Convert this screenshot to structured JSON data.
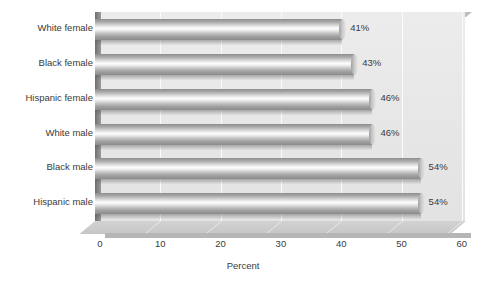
{
  "chart_data": {
    "type": "bar",
    "orientation": "horizontal",
    "title": "",
    "subtitle": "",
    "xlabel": "Percent",
    "ylabel": "",
    "categories": [
      "White female",
      "Black female",
      "Hispanic female",
      "White male",
      "Black male",
      "Hispanic male"
    ],
    "values": [
      41,
      43,
      46,
      46,
      54,
      54
    ],
    "value_labels": [
      "41%",
      "43%",
      "46%",
      "46%",
      "54%",
      "54%"
    ],
    "xticks": [
      0,
      10,
      20,
      30,
      40,
      50,
      60
    ],
    "xtick_labels": [
      "0",
      "10",
      "20",
      "30",
      "40",
      "50",
      "60"
    ],
    "xlim": [
      0,
      60
    ],
    "grid": true,
    "grid_axis": "x",
    "legend": false,
    "style": "3d-cylinder",
    "colors": {
      "background": "#ffffff",
      "plot_background": "#e8e8e8",
      "gridline": "#fbfbfb",
      "bar_light": "#fdfdfd",
      "bar_mid": "#c8c8c8",
      "bar_dark": "#8b8b8b",
      "floor": "#c6c6c6",
      "left_wall": "#8a8a8a",
      "text": "#3a3a3a"
    }
  }
}
